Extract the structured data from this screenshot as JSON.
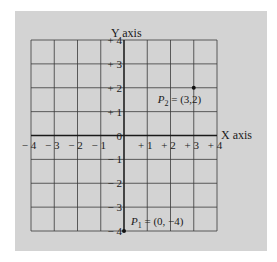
{
  "chart_data": {
    "type": "scatter",
    "title": "",
    "xlabel": "X axis",
    "ylabel": "Y axis",
    "xlim": [
      -4,
      4
    ],
    "ylim": [
      -4,
      4
    ],
    "grid": true,
    "x_ticks": [
      "-4",
      "-3",
      "-2",
      "-1",
      "+1",
      "+2",
      "+3",
      "+4"
    ],
    "y_ticks": [
      "+4",
      "+3",
      "+2",
      "+1",
      "0",
      "-1",
      "-2",
      "-3",
      "-4"
    ],
    "points": [
      {
        "name": "P2",
        "x": 3,
        "y": 2,
        "label_main": "P",
        "label_sub": "2",
        "label_rest": " = (3,2)"
      },
      {
        "name": "P1",
        "x": 0,
        "y": -4,
        "label_main": "P",
        "label_sub": "1",
        "label_rest": " = (0, −4)"
      }
    ]
  },
  "colors": {
    "background": "#d3d3d3",
    "grid": "#3a3a3a",
    "axis": "#1a1a1a",
    "point": "#111111"
  }
}
